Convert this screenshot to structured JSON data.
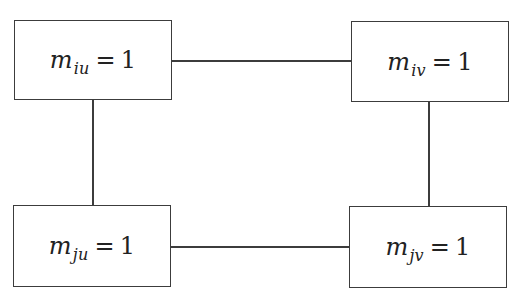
{
  "diagram": {
    "nodes": [
      {
        "id": "iu",
        "var": "m",
        "sub": "iu",
        "eq": "=",
        "value": "1",
        "position": "top-left"
      },
      {
        "id": "iv",
        "var": "m",
        "sub": "iv",
        "eq": "=",
        "value": "1",
        "position": "top-right"
      },
      {
        "id": "ju",
        "var": "m",
        "sub": "ju",
        "eq": "=",
        "value": "1",
        "position": "bottom-left"
      },
      {
        "id": "jv",
        "var": "m",
        "sub": "jv",
        "eq": "=",
        "value": "1",
        "position": "bottom-right"
      }
    ],
    "edges": [
      {
        "from": "iu",
        "to": "iv",
        "orientation": "horizontal"
      },
      {
        "from": "ju",
        "to": "jv",
        "orientation": "horizontal"
      },
      {
        "from": "iu",
        "to": "ju",
        "orientation": "vertical"
      },
      {
        "from": "iv",
        "to": "jv",
        "orientation": "vertical"
      }
    ],
    "colors": {
      "stroke": "#3c3c3c",
      "background": "#ffffff",
      "text": "#222222"
    }
  }
}
